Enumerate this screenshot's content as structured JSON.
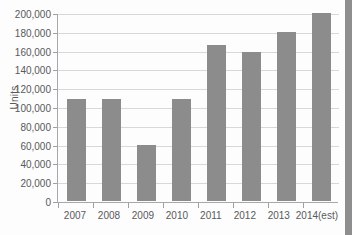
{
  "chart_data": {
    "type": "bar",
    "title": "",
    "subtitle": "",
    "xlabel": "",
    "ylabel": "Units",
    "categories": [
      "2007",
      "2008",
      "2009",
      "2010",
      "2011",
      "2012",
      "2013",
      "2014(est)"
    ],
    "values": [
      108000,
      108000,
      60000,
      108000,
      166000,
      158000,
      180000,
      200000
    ],
    "series": [
      {
        "name": "Units",
        "values": [
          108000,
          108000,
          60000,
          108000,
          166000,
          158000,
          180000,
          200000
        ]
      }
    ],
    "ylim": [
      0,
      200000
    ],
    "ytick_values": [
      0,
      20000,
      40000,
      60000,
      80000,
      100000,
      120000,
      140000,
      160000,
      180000,
      200000
    ],
    "ytick_labels": [
      "0",
      "20,000",
      "40,000",
      "60,000",
      "80,000",
      "100,000",
      "120,000",
      "140,000",
      "160,000",
      "180,000",
      "200,000"
    ],
    "grid": true,
    "legend": false,
    "legend_position": "none",
    "bar_color": "#8c8c8c",
    "gridline_color": "#d8d8d8",
    "axis_color": "#a8a8a8",
    "text_color": "#58595b",
    "background_color": "#ffffff"
  }
}
